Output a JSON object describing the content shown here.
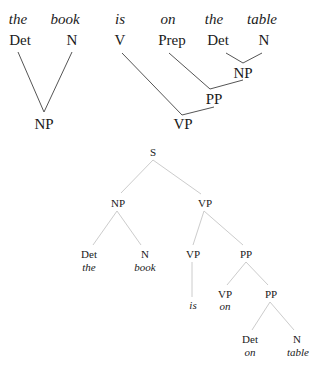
{
  "top_tree": {
    "words": [
      {
        "text": "the",
        "x": 18,
        "y": 12
      },
      {
        "text": "book",
        "x": 65,
        "y": 12
      },
      {
        "text": "is",
        "x": 120,
        "y": 12
      },
      {
        "text": "on",
        "x": 168,
        "y": 12
      },
      {
        "text": "the",
        "x": 214,
        "y": 12
      },
      {
        "text": "table",
        "x": 262,
        "y": 12
      }
    ],
    "categories": [
      {
        "text": "Det",
        "x": 20,
        "y": 33
      },
      {
        "text": "N",
        "x": 72,
        "y": 33
      },
      {
        "text": "V",
        "x": 120,
        "y": 33
      },
      {
        "text": "Prep",
        "x": 172,
        "y": 33
      },
      {
        "text": "Det",
        "x": 218,
        "y": 33
      },
      {
        "text": "N",
        "x": 264,
        "y": 33
      }
    ],
    "phrases": [
      {
        "text": "NP",
        "x": 44,
        "y": 117
      },
      {
        "text": "NP",
        "x": 241,
        "y": 68
      },
      {
        "text": "PP",
        "x": 215,
        "y": 95
      },
      {
        "text": "VP",
        "x": 183,
        "y": 121
      }
    ]
  },
  "bottom_tree": {
    "nodes": [
      {
        "text": "S",
        "x": 153,
        "y": 147
      },
      {
        "text": "NP",
        "x": 118,
        "y": 199
      },
      {
        "text": "VP",
        "x": 205,
        "y": 199
      },
      {
        "text": "Det",
        "x": 89,
        "y": 250
      },
      {
        "text": "N",
        "x": 145,
        "y": 250
      },
      {
        "text": "VP",
        "x": 193,
        "y": 250
      },
      {
        "text": "PP",
        "x": 246,
        "y": 250
      },
      {
        "text": "VP",
        "x": 225,
        "y": 290
      },
      {
        "text": "PP",
        "x": 271,
        "y": 290
      },
      {
        "text": "Det",
        "x": 250,
        "y": 335
      },
      {
        "text": "N",
        "x": 297,
        "y": 335
      }
    ],
    "words": [
      {
        "text": "the",
        "x": 89,
        "y": 263
      },
      {
        "text": "book",
        "x": 145,
        "y": 263
      },
      {
        "text": "is",
        "x": 193,
        "y": 301
      },
      {
        "text": "on",
        "x": 225,
        "y": 303
      },
      {
        "text": "on",
        "x": 250,
        "y": 348
      },
      {
        "text": "table",
        "x": 298,
        "y": 348
      }
    ]
  },
  "line_colors": {
    "top": "#555555",
    "bottom": "#cccccc"
  }
}
